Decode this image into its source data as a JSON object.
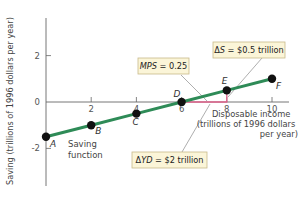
{
  "chart_data": {
    "type": "line",
    "title": "",
    "xlabel": "Disposable income (trillions of 1996 dollars per year)",
    "xlabel_lines": [
      "Disposable income",
      "(trillions of 1996 dollars",
      "per year)"
    ],
    "ylabel": "Saving (trillions of 1996 dollars per year)",
    "xlim": [
      0,
      10.7
    ],
    "ylim": [
      -3.6,
      3.6
    ],
    "x_ticks": [
      2,
      4,
      6,
      8,
      10
    ],
    "x_tick_labels": [
      "2",
      "4",
      "6",
      "8",
      "10"
    ],
    "y_ticks": [
      2,
      0,
      -2
    ],
    "y_tick_labels": [
      "2",
      "0",
      "-2"
    ],
    "grid": false,
    "series": [
      {
        "name": "Saving function",
        "color": "#2e8b57",
        "points": [
          {
            "label": "A",
            "x": 0,
            "y": -1.5
          },
          {
            "label": "B",
            "x": 2,
            "y": -1.0
          },
          {
            "label": "C",
            "x": 4,
            "y": -0.5
          },
          {
            "label": "D",
            "x": 6,
            "y": 0.0
          },
          {
            "label": "E",
            "x": 8,
            "y": 0.5
          },
          {
            "label": "F",
            "x": 10,
            "y": 1.0
          }
        ]
      }
    ],
    "series_label": [
      "Saving",
      "function"
    ],
    "slope_triangle": {
      "color": "#e0608a",
      "from": {
        "x": 6,
        "y": 0
      },
      "corner": {
        "x": 8,
        "y": 0
      },
      "to": {
        "x": 8,
        "y": 0.5
      }
    },
    "annotations": [
      {
        "id": "mps",
        "text_italic": "MPS",
        "text_rest": " = 0.25"
      },
      {
        "id": "delta_s",
        "text_prefix": "Δ",
        "text_italic": "S",
        "text_rest": " = $0.5 trillion"
      },
      {
        "id": "delta_yd",
        "text_prefix": "Δ",
        "text_italic": "YD",
        "text_rest": " = $2 trillion"
      }
    ]
  },
  "colors": {
    "line": "#2e8b57",
    "triangle": "#e0608a",
    "axis": "#666666",
    "note_fill": "#fbf5d8",
    "note_border": "#c8b98a"
  }
}
